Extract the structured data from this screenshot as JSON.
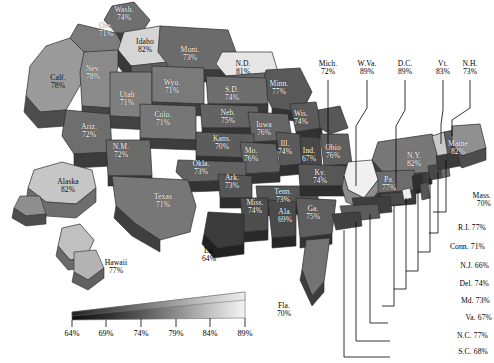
{
  "chart_data": {
    "type": "map",
    "title": "",
    "subtitle": "",
    "units": "percent",
    "value_suffix": "%",
    "colormap": {
      "low_color": "#111111",
      "high_color": "#f2f2f2",
      "min": 64,
      "max": 89
    },
    "legend": {
      "ticks": [
        "64%",
        "69%",
        "74%",
        "79%",
        "84%",
        "89%"
      ],
      "tick_values": [
        64,
        69,
        74,
        79,
        84,
        89
      ],
      "orientation": "horizontal-wedge",
      "position": "bottom-left"
    },
    "states_on_map": [
      {
        "name": "Wash.",
        "value": "74%",
        "x": 124,
        "y": 14,
        "tone": "onmap"
      },
      {
        "name": "Ore.",
        "value": "71%",
        "x": 106,
        "y": 30,
        "tone": "onmap"
      },
      {
        "name": "Idaho",
        "value": "82%",
        "x": 145,
        "y": 46,
        "tone": "dark"
      },
      {
        "name": "Mont.",
        "value": "73%",
        "x": 190,
        "y": 54,
        "tone": "onmap"
      },
      {
        "name": "N.D.",
        "value": "81%",
        "x": 243,
        "y": 68,
        "tone": "dark"
      },
      {
        "name": "Minn.",
        "value": "77%",
        "x": 279,
        "y": 88,
        "tone": "onmap"
      },
      {
        "name": "Calf.",
        "value": "78%",
        "x": 58,
        "y": 82,
        "tone": "dark"
      },
      {
        "name": "Nev.",
        "value": "78%",
        "x": 93,
        "y": 73,
        "tone": "onmap"
      },
      {
        "name": "Utah",
        "value": "71%",
        "x": 127,
        "y": 99,
        "tone": "onmap"
      },
      {
        "name": "Wyo.",
        "value": "71%",
        "x": 172,
        "y": 87,
        "tone": "onmap"
      },
      {
        "name": "S.D.",
        "value": "74%",
        "x": 232,
        "y": 94,
        "tone": "onmap"
      },
      {
        "name": "Ariz.",
        "value": "72%",
        "x": 89,
        "y": 131,
        "tone": "onmap"
      },
      {
        "name": "Colo.",
        "value": "71%",
        "x": 163,
        "y": 119,
        "tone": "onmap"
      },
      {
        "name": "Neb.",
        "value": "75%",
        "x": 228,
        "y": 117,
        "tone": "onmap"
      },
      {
        "name": "Iowa",
        "value": "76%",
        "x": 264,
        "y": 129,
        "tone": "onmap"
      },
      {
        "name": "Wis.",
        "value": "74%",
        "x": 301,
        "y": 118,
        "tone": "onmap"
      },
      {
        "name": "N.M.",
        "value": "72%",
        "x": 121,
        "y": 151,
        "tone": "onmap"
      },
      {
        "name": "Kans.",
        "value": "70%",
        "x": 222,
        "y": 143,
        "tone": "onmap"
      },
      {
        "name": "Mo.",
        "value": "76%",
        "x": 251,
        "y": 155,
        "tone": "onmap"
      },
      {
        "name": "Ill.",
        "value": "74%",
        "x": 285,
        "y": 148,
        "tone": "onmap"
      },
      {
        "name": "Ind.",
        "value": "67%",
        "x": 309,
        "y": 155,
        "tone": "onmap"
      },
      {
        "name": "Ohio",
        "value": "76%",
        "x": 333,
        "y": 152,
        "tone": "onmap"
      },
      {
        "name": "Okla.",
        "value": "73%",
        "x": 201,
        "y": 168,
        "tone": "onmap"
      },
      {
        "name": "Ark.",
        "value": "73%",
        "x": 232,
        "y": 182,
        "tone": "onmap"
      },
      {
        "name": "Tenn.",
        "value": "73%",
        "x": 283,
        "y": 196,
        "tone": "onmap"
      },
      {
        "name": "Ky.",
        "value": "74%",
        "x": 320,
        "y": 177,
        "tone": "onmap"
      },
      {
        "name": "Texas",
        "value": "71%",
        "x": 163,
        "y": 201,
        "tone": "onmap"
      },
      {
        "name": "Miss.",
        "value": "74%",
        "x": 255,
        "y": 207,
        "tone": "onmap"
      },
      {
        "name": "Ala.",
        "value": "69%",
        "x": 285,
        "y": 216,
        "tone": "onmap"
      },
      {
        "name": "Ga.",
        "value": "75%",
        "x": 313,
        "y": 213,
        "tone": "onmap"
      },
      {
        "name": "La.",
        "value": "64%",
        "x": 209,
        "y": 255,
        "tone": "out"
      },
      {
        "name": "Fla.",
        "value": "70%",
        "x": 284,
        "y": 310,
        "tone": "out"
      },
      {
        "name": "Alaska",
        "value": "82%",
        "x": 68,
        "y": 186,
        "tone": "dark"
      },
      {
        "name": "Hawaii",
        "value": "77%",
        "x": 116,
        "y": 267,
        "tone": "out"
      },
      {
        "name": "N.Y.",
        "value": "82%",
        "x": 414,
        "y": 160,
        "tone": "onmap"
      },
      {
        "name": "Pa.",
        "value": "77%",
        "x": 389,
        "y": 184,
        "tone": "onmap"
      },
      {
        "name": "Maine",
        "value": "82%",
        "x": 458,
        "y": 148,
        "tone": "onmap"
      }
    ],
    "callouts_top": [
      {
        "name": "Mich.",
        "value": "72%",
        "x": 328,
        "y": 68
      },
      {
        "name": "W.Va.",
        "value": "89%",
        "x": 367,
        "y": 68
      },
      {
        "name": "D.C.",
        "value": "89%",
        "x": 405,
        "y": 68
      },
      {
        "name": "Vt.",
        "value": "83%",
        "x": 443,
        "y": 68
      },
      {
        "name": "N.H.",
        "value": "73%",
        "x": 470,
        "y": 68
      }
    ],
    "callouts_right": [
      {
        "label": "Mass.",
        "value": "70%",
        "x": 455,
        "y": 200,
        "two_line": true
      },
      {
        "label": "R.I.",
        "value": "77%",
        "x": 450,
        "y": 232,
        "two_line": false
      },
      {
        "label": "Conn.",
        "value": "71%",
        "x": 449,
        "y": 251,
        "two_line": false
      },
      {
        "label": "N.J.",
        "value": "66%",
        "x": 453,
        "y": 270,
        "two_line": false
      },
      {
        "label": "Del.",
        "value": "74%",
        "x": 453,
        "y": 288,
        "two_line": false
      },
      {
        "label": "Md.",
        "value": "73%",
        "x": 454,
        "y": 305,
        "two_line": false
      },
      {
        "label": "Va.",
        "value": "67%",
        "x": 456,
        "y": 322,
        "two_line": false
      },
      {
        "label": "N.C.",
        "value": "77%",
        "x": 452,
        "y": 340,
        "two_line": false
      },
      {
        "label": "S.C.",
        "value": "68%",
        "x": 452,
        "y": 356,
        "two_line": false
      }
    ]
  }
}
